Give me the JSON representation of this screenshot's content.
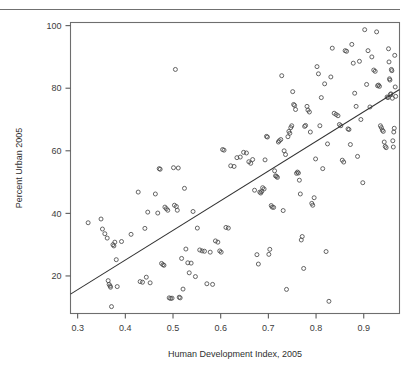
{
  "page": {
    "background": "#ffffff",
    "rule_color": "#707070"
  },
  "chart_data": {
    "type": "scatter",
    "title": "",
    "xlabel": "Human Development Index, 2005",
    "ylabel": "Percent Urban 2005",
    "xlim": [
      0.285,
      0.975
    ],
    "ylim": [
      8,
      101
    ],
    "xticks": [
      0.3,
      0.4,
      0.5,
      0.6,
      0.7,
      0.8,
      0.9
    ],
    "xtick_labels": [
      "0.3",
      "0.4",
      "0.5",
      "0.6",
      "0.7",
      "0.8",
      "0.9"
    ],
    "yticks": [
      20,
      40,
      60,
      80,
      100
    ],
    "ytick_labels": [
      "20",
      "40",
      "60",
      "80",
      "100"
    ],
    "grid": false,
    "legend": false,
    "marker": "open-circle",
    "marker_color": "#4a4a4a",
    "trendline": {
      "type": "linear-fit",
      "color": "#333333",
      "x_start": 0.285,
      "y_start": 14.2,
      "x_end": 0.975,
      "y_end": 79.6
    },
    "x": [
      0.322,
      0.349,
      0.352,
      0.357,
      0.362,
      0.364,
      0.366,
      0.368,
      0.369,
      0.371,
      0.374,
      0.376,
      0.378,
      0.381,
      0.383,
      0.392,
      0.412,
      0.427,
      0.431,
      0.436,
      0.441,
      0.444,
      0.447,
      0.452,
      0.463,
      0.468,
      0.471,
      0.473,
      0.476,
      0.479,
      0.481,
      0.483,
      0.486,
      0.489,
      0.492,
      0.495,
      0.498,
      0.501,
      0.503,
      0.505,
      0.507,
      0.509,
      0.511,
      0.513,
      0.515,
      0.518,
      0.521,
      0.524,
      0.527,
      0.531,
      0.534,
      0.538,
      0.542,
      0.547,
      0.551,
      0.556,
      0.561,
      0.566,
      0.571,
      0.578,
      0.583,
      0.589,
      0.594,
      0.598,
      0.601,
      0.604,
      0.607,
      0.611,
      0.616,
      0.621,
      0.628,
      0.634,
      0.641,
      0.648,
      0.654,
      0.659,
      0.663,
      0.667,
      0.671,
      0.676,
      0.679,
      0.682,
      0.684,
      0.686,
      0.688,
      0.691,
      0.693,
      0.696,
      0.698,
      0.701,
      0.703,
      0.706,
      0.708,
      0.711,
      0.713,
      0.715,
      0.717,
      0.719,
      0.721,
      0.723,
      0.726,
      0.728,
      0.731,
      0.733,
      0.736,
      0.738,
      0.741,
      0.743,
      0.745,
      0.747,
      0.749,
      0.751,
      0.753,
      0.755,
      0.757,
      0.759,
      0.761,
      0.763,
      0.765,
      0.767,
      0.769,
      0.771,
      0.774,
      0.776,
      0.778,
      0.781,
      0.783,
      0.786,
      0.788,
      0.791,
      0.793,
      0.796,
      0.799,
      0.802,
      0.805,
      0.808,
      0.811,
      0.814,
      0.818,
      0.821,
      0.824,
      0.827,
      0.831,
      0.834,
      0.838,
      0.842,
      0.846,
      0.849,
      0.852,
      0.855,
      0.858,
      0.861,
      0.864,
      0.867,
      0.869,
      0.872,
      0.875,
      0.878,
      0.881,
      0.884,
      0.887,
      0.891,
      0.894,
      0.898,
      0.902,
      0.906,
      0.909,
      0.913,
      0.917,
      0.921,
      0.924,
      0.927,
      0.929,
      0.931,
      0.933,
      0.935,
      0.937,
      0.939,
      0.941,
      0.943,
      0.945,
      0.947,
      0.949,
      0.951,
      0.952,
      0.953,
      0.954,
      0.955,
      0.956,
      0.957,
      0.958,
      0.959,
      0.96,
      0.961,
      0.962,
      0.963,
      0.964,
      0.965,
      0.966,
      0.967
    ],
    "y": [
      37.0,
      38.2,
      35.0,
      33.5,
      32.1,
      18.5,
      17.3,
      16.8,
      16.4,
      10.2,
      30.0,
      29.6,
      30.8,
      25.2,
      16.6,
      31.0,
      33.3,
      46.8,
      18.2,
      18.0,
      35.2,
      19.6,
      40.4,
      17.8,
      46.2,
      40.1,
      54.3,
      54.1,
      24.0,
      23.6,
      23.4,
      42.0,
      41.5,
      41.0,
      13.0,
      12.8,
      12.9,
      54.6,
      42.6,
      86.0,
      42.2,
      41.0,
      54.5,
      13.2,
      13.0,
      25.6,
      15.8,
      48.0,
      28.6,
      24.2,
      21.0,
      24.1,
      40.6,
      19.8,
      35.3,
      28.3,
      28.0,
      27.9,
      17.5,
      27.6,
      17.3,
      31.2,
      30.8,
      28.0,
      27.6,
      60.4,
      60.2,
      35.5,
      35.3,
      55.2,
      55.0,
      57.8,
      58.0,
      59.5,
      59.3,
      56.5,
      56.0,
      57.2,
      47.4,
      26.8,
      23.8,
      46.8,
      46.5,
      47.0,
      48.2,
      47.8,
      57.1,
      64.6,
      64.4,
      26.9,
      28.5,
      42.5,
      42.0,
      41.9,
      53.6,
      52.0,
      51.8,
      51.5,
      62.8,
      63.2,
      63.6,
      84.0,
      40.9,
      60.0,
      58.8,
      15.7,
      64.5,
      66.2,
      65.6,
      67.4,
      68.0,
      78.9,
      74.8,
      74.5,
      73.2,
      52.8,
      53.2,
      52.9,
      50.6,
      46.2,
      31.5,
      32.6,
      22.4,
      67.8,
      68.1,
      74.2,
      73.0,
      72.4,
      66.0,
      43.2,
      42.6,
      45.0,
      57.4,
      86.9,
      84.6,
      68.0,
      77.0,
      54.3,
      81.4,
      27.8,
      62.2,
      11.9,
      83.6,
      92.8,
      72.0,
      71.6,
      71.2,
      68.4,
      68.0,
      57.0,
      56.4,
      92.0,
      91.8,
      67.0,
      66.8,
      62.0,
      94.0,
      88.0,
      78.4,
      74.2,
      58.2,
      88.6,
      70.0,
      49.8,
      98.7,
      81.2,
      92.0,
      74.0,
      90.0,
      85.8,
      85.4,
      98.0,
      80.8,
      81.0,
      80.6,
      68.0,
      67.4,
      66.6,
      66.2,
      62.8,
      61.4,
      61.0,
      77.2,
      77.0,
      92.6,
      88.4,
      83.0,
      82.6,
      78.0,
      78.2,
      86.0,
      85.6,
      76.8,
      63.2,
      61.2,
      66.0,
      67.2,
      90.5,
      80.4,
      77.4
    ]
  }
}
